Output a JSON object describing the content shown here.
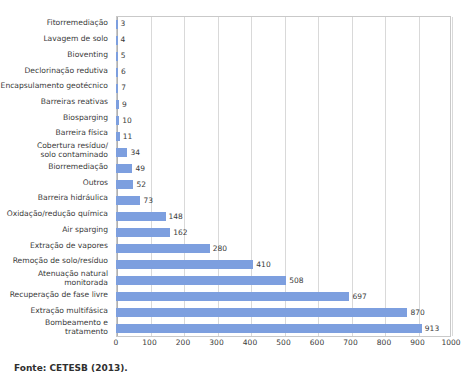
{
  "figure": {
    "caption": "Fonte: CETESB (2013)."
  },
  "chart_data": {
    "type": "bar",
    "orientation": "horizontal",
    "title": "",
    "xlabel": "",
    "ylabel": "",
    "xlim": [
      0,
      1000
    ],
    "xticks": [
      0,
      100,
      200,
      300,
      400,
      500,
      600,
      700,
      800,
      900,
      1000
    ],
    "grid": true,
    "legend": false,
    "bar_color": "#7d9fdf",
    "data_labels": true,
    "categories": [
      "Fitorremediação",
      "Lavagem de solo",
      "Bioventing",
      "Declorinação redutiva",
      "Encapsulamento geotécnico",
      "Barreiras reativas",
      "Biosparging",
      "Barreira física",
      "Cobertura resíduo/\nsolo contaminado",
      "Biorremediação",
      "Outros",
      "Barreira hidráulica",
      "Oxidação/redução química",
      "Air sparging",
      "Extração de vapores",
      "Remoção de solo/resíduo",
      "Atenuação natural\nmonitorada",
      "Recuperação de fase livre",
      "Extração multifásica",
      "Bombeamento e tratamento"
    ],
    "values": [
      3,
      4,
      5,
      6,
      7,
      9,
      10,
      11,
      34,
      49,
      52,
      73,
      148,
      162,
      280,
      410,
      508,
      697,
      870,
      913
    ]
  }
}
